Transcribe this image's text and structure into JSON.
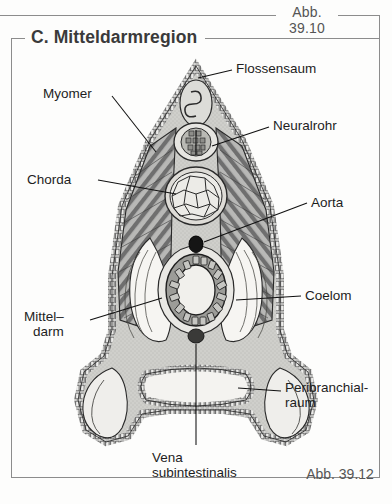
{
  "figure": {
    "panel_label": "C. Mitteldarmregion",
    "caption_top": "Abb. 39.10",
    "caption_bottom": "Abb. 39.12"
  },
  "labels": {
    "myomer": "Myomer",
    "chorda": "Chorda",
    "mitteldarm_line1": "Mittel–",
    "mitteldarm_line2": "darm",
    "flossensaum": "Flossensaum",
    "neuralrohr": "Neuralrohr",
    "aorta": "Aorta",
    "coelom": "Coelom",
    "peribranchial_line1": "Peribranchial-",
    "peribranchial_line2": "raum",
    "vena_line1": "Vena",
    "vena_line2": "subintestinalis"
  },
  "colors": {
    "frame": "#8c8c8c",
    "title": "#3a3a3a",
    "label_text": "#1e1e1e",
    "caption": "#555555",
    "tissue_fill": "#c9c9c5",
    "lumen_fill": "#f2f1ee",
    "muscle_dark": "#6e6e6e",
    "outline": "#2a2a2a",
    "vessel_dark": "#1a1a1a",
    "page_bg": "#fdfdfc"
  }
}
